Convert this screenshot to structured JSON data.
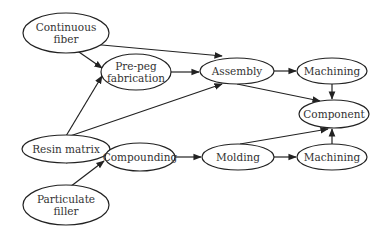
{
  "diagram": {
    "nodes": [
      {
        "id": "continuous_fiber",
        "lines": [
          "Continuous",
          "fiber"
        ],
        "cx": 66,
        "cy": 33,
        "rx": 43,
        "ry": 20
      },
      {
        "id": "prepeg",
        "lines": [
          "Pre-peg",
          "fabrication"
        ],
        "cx": 136,
        "cy": 72,
        "rx": 35,
        "ry": 18
      },
      {
        "id": "assembly",
        "lines": [
          "Assembly"
        ],
        "cx": 237,
        "cy": 71,
        "rx": 37,
        "ry": 13
      },
      {
        "id": "machining_top",
        "lines": [
          "Machining"
        ],
        "cx": 332,
        "cy": 71,
        "rx": 35,
        "ry": 13
      },
      {
        "id": "resin_matrix",
        "lines": [
          "Resin matrix"
        ],
        "cx": 66,
        "cy": 149,
        "rx": 44,
        "ry": 14
      },
      {
        "id": "component",
        "lines": [
          "Component"
        ],
        "cx": 334,
        "cy": 114,
        "rx": 35,
        "ry": 14
      },
      {
        "id": "compounding",
        "lines": [
          "Compounding"
        ],
        "cx": 140,
        "cy": 157,
        "rx": 35,
        "ry": 14
      },
      {
        "id": "molding",
        "lines": [
          "Molding"
        ],
        "cx": 238,
        "cy": 157,
        "rx": 36,
        "ry": 13
      },
      {
        "id": "machining_bottom",
        "lines": [
          "Machining"
        ],
        "cx": 332,
        "cy": 157,
        "rx": 35,
        "ry": 13
      },
      {
        "id": "particulate_filler",
        "lines": [
          "Particulate",
          "filler"
        ],
        "cx": 66,
        "cy": 205,
        "rx": 43,
        "ry": 20
      }
    ],
    "edges": [
      {
        "from": "continuous_fiber",
        "to": "prepeg",
        "x1": 66,
        "y1": 43,
        "x2": 102,
        "y2": 68
      },
      {
        "from": "continuous_fiber",
        "to": "assembly",
        "x1": 80,
        "y1": 43,
        "x2": 222,
        "y2": 56
      },
      {
        "from": "resin_matrix",
        "to": "prepeg",
        "x1": 66,
        "y1": 136,
        "x2": 102,
        "y2": 76
      },
      {
        "from": "resin_matrix",
        "to": "assembly",
        "x1": 70,
        "y1": 136,
        "x2": 222,
        "y2": 84
      },
      {
        "from": "prepeg",
        "to": "assembly",
        "x1": 171,
        "y1": 72,
        "x2": 199,
        "y2": 72
      },
      {
        "from": "assembly",
        "to": "machining_top",
        "x1": 274,
        "y1": 71,
        "x2": 296,
        "y2": 71
      },
      {
        "from": "assembly",
        "to": "component",
        "x1": 237,
        "y1": 84,
        "x2": 320,
        "y2": 101
      },
      {
        "from": "machining_top",
        "to": "component",
        "x1": 332,
        "y1": 84,
        "x2": 332,
        "y2": 99
      },
      {
        "from": "resin_matrix",
        "to": "compounding",
        "x1": 66,
        "y1": 163,
        "x2": 104,
        "y2": 153
      },
      {
        "from": "particulate_filler",
        "to": "compounding",
        "x1": 66,
        "y1": 190,
        "x2": 104,
        "y2": 161
      },
      {
        "from": "compounding",
        "to": "molding",
        "x1": 175,
        "y1": 157,
        "x2": 201,
        "y2": 157
      },
      {
        "from": "molding",
        "to": "machining_bottom",
        "x1": 274,
        "y1": 157,
        "x2": 296,
        "y2": 157
      },
      {
        "from": "molding",
        "to": "component",
        "x1": 240,
        "y1": 144,
        "x2": 328,
        "y2": 129
      },
      {
        "from": "machining_bottom",
        "to": "component",
        "x1": 332,
        "y1": 144,
        "x2": 332,
        "y2": 129
      }
    ]
  }
}
